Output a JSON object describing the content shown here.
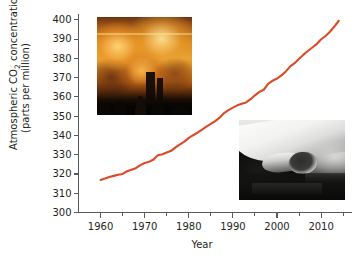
{
  "figure": {
    "name": "atmospheric-co2-concentration-chart",
    "line_color": "#DC4A28",
    "axis_color": "#58595B",
    "text_color": "#231F20",
    "background": "#FFFFFF"
  },
  "axes": {
    "y_title_line1_part1": "Atmospheric CO",
    "y_title_sub": "2",
    "y_title_line1_part2": " concentration",
    "y_title_line2": "(parts per million)",
    "x_title": "Year",
    "y_ticks": [
      "300",
      "310",
      "320",
      "330",
      "340",
      "350",
      "360",
      "370",
      "380",
      "390",
      "400"
    ],
    "x_ticks": [
      "1960",
      "1970",
      "1980",
      "1990",
      "2000",
      "2010"
    ]
  },
  "insets": {
    "fire": {
      "alt": "smokestack-emissions-fire-photo"
    },
    "exhaust": {
      "alt": "car-exhaust-tailpipe-photo"
    }
  },
  "chart_data": {
    "type": "line",
    "title": "",
    "xlabel": "Year",
    "ylabel": "Atmospheric CO2 concentration (parts per million)",
    "xlim": [
      1955,
      2017
    ],
    "ylim": [
      300,
      403
    ],
    "x_major_ticks": [
      1960,
      1970,
      1980,
      1990,
      2000,
      2010
    ],
    "x_minor_ticks": [
      1965,
      1975,
      1985,
      1995,
      2005,
      2015
    ],
    "y_major_ticks": [
      300,
      310,
      320,
      330,
      340,
      350,
      360,
      370,
      380,
      390,
      400
    ],
    "grid": false,
    "legend": false,
    "series": [
      {
        "name": "Atmospheric CO2",
        "units": "parts per million",
        "x": [
          1960,
          1961,
          1962,
          1963,
          1964,
          1965,
          1966,
          1967,
          1968,
          1969,
          1970,
          1971,
          1972,
          1973,
          1974,
          1975,
          1976,
          1977,
          1978,
          1979,
          1980,
          1981,
          1982,
          1983,
          1984,
          1985,
          1986,
          1987,
          1988,
          1989,
          1990,
          1991,
          1992,
          1993,
          1994,
          1995,
          1996,
          1997,
          1998,
          1999,
          2000,
          2001,
          2002,
          2003,
          2004,
          2005,
          2006,
          2007,
          2008,
          2009,
          2010,
          2011,
          2012,
          2013,
          2014
        ],
        "values": [
          316.9,
          317.6,
          318.4,
          319.0,
          319.6,
          320.0,
          321.4,
          322.2,
          323.0,
          324.6,
          325.7,
          326.3,
          327.5,
          329.7,
          330.2,
          331.1,
          332.0,
          333.8,
          335.4,
          336.8,
          338.7,
          340.1,
          341.4,
          343.0,
          344.6,
          346.0,
          347.4,
          349.2,
          351.6,
          353.1,
          354.4,
          355.6,
          356.4,
          357.1,
          358.8,
          360.8,
          362.6,
          363.7,
          366.7,
          368.4,
          369.5,
          371.1,
          373.2,
          375.8,
          377.5,
          379.8,
          381.9,
          383.8,
          385.6,
          387.4,
          389.9,
          391.6,
          393.8,
          396.5,
          399.5
        ]
      }
    ]
  }
}
